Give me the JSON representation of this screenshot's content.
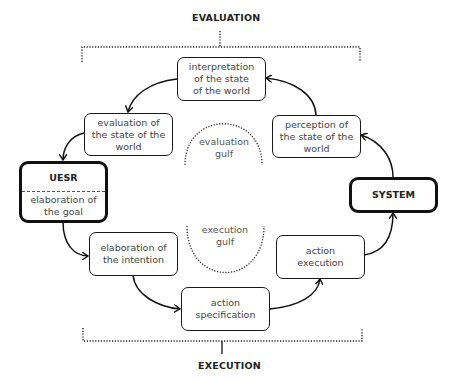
{
  "diagram": {
    "title_top": "EVALUATION",
    "title_bottom": "EXECUTION",
    "nodes": {
      "interpretation": "interpretation\nof the state\nof the world",
      "evaluation": "evaluation of\nthe state of the\nworld",
      "perception": "perception of\nthe state of the\nworld",
      "user": {
        "title": "UESR",
        "subtitle": "elaboration of\nthe goal"
      },
      "system": "SYSTEM",
      "intention": "elaboration of\nthe intention",
      "execution": "action\nexecution",
      "specification": "action\nspecification"
    },
    "gulfs": {
      "evaluation": "evaluation\ngulf",
      "execution": "execution\ngulf"
    },
    "edges": [
      {
        "from": "system",
        "to": "perception"
      },
      {
        "from": "perception",
        "to": "interpretation"
      },
      {
        "from": "interpretation",
        "to": "evaluation"
      },
      {
        "from": "evaluation",
        "to": "user"
      },
      {
        "from": "user",
        "to": "intention"
      },
      {
        "from": "intention",
        "to": "specification"
      },
      {
        "from": "specification",
        "to": "execution"
      },
      {
        "from": "execution",
        "to": "system"
      }
    ]
  }
}
